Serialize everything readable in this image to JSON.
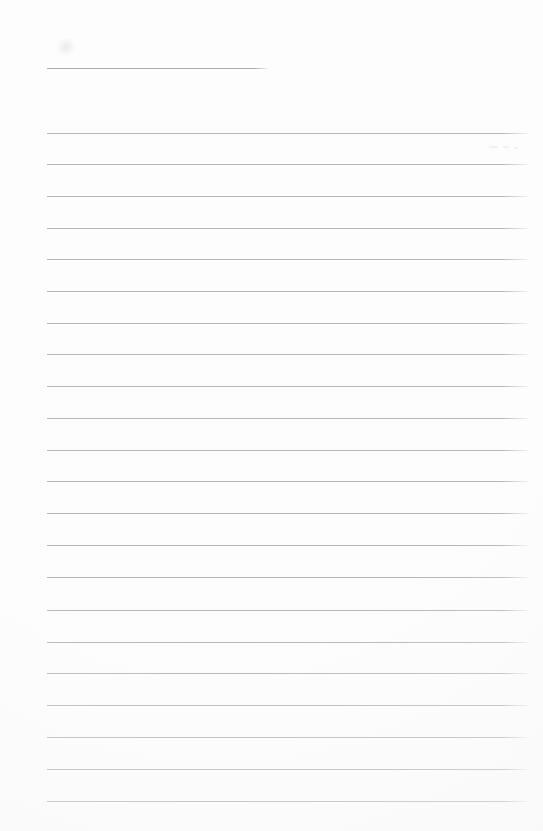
{
  "document": {
    "kind": "scanned-lined-paper",
    "title_line_present": true,
    "body_text": "",
    "page_width": 543,
    "page_height": 831,
    "background_color": "#fdfdfd",
    "rule_color": "#b8b8bc",
    "header_rule_color": "#adadb2"
  },
  "ruling": {
    "left_margin_x": 47,
    "right_edge_x": 528,
    "line_spacing": 31.8,
    "line_thickness": 1,
    "first_body_line_y": 133,
    "last_body_line_y": 801,
    "body_line_count": 22
  },
  "header_rule": {
    "name": "title-rule",
    "x": 47,
    "y": 68,
    "width": 221,
    "end_x": 268
  },
  "body_rules": [
    {
      "index": 1,
      "y": 133
    },
    {
      "index": 2,
      "y": 164
    },
    {
      "index": 3,
      "y": 196
    },
    {
      "index": 4,
      "y": 228
    },
    {
      "index": 5,
      "y": 259
    },
    {
      "index": 6,
      "y": 291
    },
    {
      "index": 7,
      "y": 323
    },
    {
      "index": 8,
      "y": 354
    },
    {
      "index": 9,
      "y": 386
    },
    {
      "index": 10,
      "y": 418
    },
    {
      "index": 11,
      "y": 450
    },
    {
      "index": 12,
      "y": 481
    },
    {
      "index": 13,
      "y": 513
    },
    {
      "index": 14,
      "y": 545
    },
    {
      "index": 15,
      "y": 577
    },
    {
      "index": 16,
      "y": 610
    },
    {
      "index": 17,
      "y": 642
    },
    {
      "index": 18,
      "y": 673
    },
    {
      "index": 19,
      "y": 705
    },
    {
      "index": 20,
      "y": 737
    },
    {
      "index": 21,
      "y": 769
    },
    {
      "index": 22,
      "y": 801
    }
  ],
  "artifacts": [
    {
      "name": "scan-speckle",
      "x": 489,
      "y": 146,
      "width": 9,
      "height": 2
    },
    {
      "name": "scan-speckle",
      "x": 503,
      "y": 146,
      "width": 6,
      "height": 2
    },
    {
      "name": "scan-speckle",
      "x": 514,
      "y": 147,
      "width": 4,
      "height": 2
    },
    {
      "name": "paper-smudge",
      "x": 55,
      "y": 38,
      "width": 22,
      "height": 18
    }
  ]
}
